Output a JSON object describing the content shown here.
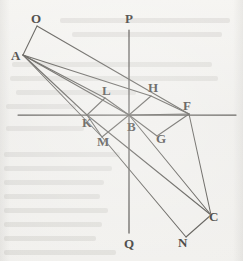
{
  "figure": {
    "background_color": "#f2f1ee",
    "ink_color": "#56544f",
    "label_color": "#3b3936"
  },
  "axes": {
    "vertical": {
      "top_label": "P",
      "bottom_label": "Q",
      "x": 129,
      "y1": 30,
      "y2": 233
    },
    "horizontal": {
      "y": 115,
      "x1": 18,
      "x2": 236
    }
  },
  "points": [
    {
      "id": "O",
      "label": "O",
      "x": 37,
      "y": 26,
      "lx": 31,
      "ly": 12
    },
    {
      "id": "A",
      "label": "A",
      "x": 23,
      "y": 55,
      "lx": 11,
      "ly": 49
    },
    {
      "id": "P",
      "label": "P",
      "x": 129,
      "y": 30,
      "lx": 125,
      "ly": 12
    },
    {
      "id": "L",
      "label": "L",
      "x": 105,
      "y": 98,
      "lx": 102,
      "ly": 84
    },
    {
      "id": "H",
      "label": "H",
      "x": 151,
      "y": 96,
      "lx": 148,
      "ly": 81
    },
    {
      "id": "F",
      "label": "F",
      "x": 189,
      "y": 114,
      "lx": 183,
      "ly": 99
    },
    {
      "id": "K",
      "label": "K",
      "x": 87,
      "y": 115,
      "lx": 82,
      "ly": 116
    },
    {
      "id": "B",
      "label": "B",
      "x": 129,
      "y": 115,
      "lx": 127,
      "ly": 120
    },
    {
      "id": "G",
      "label": "G",
      "x": 157,
      "y": 136,
      "lx": 156,
      "ly": 132
    },
    {
      "id": "M",
      "label": "M",
      "x": 102,
      "y": 137,
      "lx": 97,
      "ly": 135
    },
    {
      "id": "C",
      "label": "C",
      "x": 211,
      "y": 215,
      "lx": 209,
      "ly": 210
    },
    {
      "id": "N",
      "label": "N",
      "x": 186,
      "y": 237,
      "lx": 178,
      "ly": 236
    },
    {
      "id": "Q",
      "label": "Q",
      "x": 129,
      "y": 233,
      "lx": 124,
      "ly": 237
    }
  ],
  "segments": [
    {
      "name": "O-A",
      "from": "O",
      "to": "A"
    },
    {
      "name": "O-F",
      "from": "O",
      "to": "F"
    },
    {
      "name": "A-H",
      "from": "A",
      "to": "H"
    },
    {
      "name": "H-F",
      "from": "H",
      "to": "F"
    },
    {
      "name": "A-B",
      "from": "A",
      "to": "B"
    },
    {
      "name": "B-F",
      "from": "B",
      "to": "F"
    },
    {
      "name": "A-K",
      "from": "A",
      "to": "K"
    },
    {
      "name": "A-M",
      "from": "A",
      "to": "M"
    },
    {
      "name": "A-L",
      "from": "A",
      "to": "L"
    },
    {
      "name": "L-K",
      "from": "L",
      "to": "K"
    },
    {
      "name": "L-B",
      "from": "L",
      "to": "B"
    },
    {
      "name": "H-B",
      "from": "H",
      "to": "B"
    },
    {
      "name": "K-M",
      "from": "K",
      "to": "M"
    },
    {
      "name": "M-B",
      "from": "M",
      "to": "B"
    },
    {
      "name": "K-C",
      "from": "K",
      "to": "C"
    },
    {
      "name": "B-C",
      "from": "B",
      "to": "C"
    },
    {
      "name": "F-C",
      "from": "F",
      "to": "C"
    },
    {
      "name": "B-G",
      "from": "B",
      "to": "G"
    },
    {
      "name": "G-F",
      "from": "G",
      "to": "F"
    },
    {
      "name": "M-N",
      "from": "M",
      "to": "N"
    },
    {
      "name": "N-C",
      "from": "N",
      "to": "C"
    }
  ],
  "bleed_text_lines": [
    {
      "x": 60,
      "y": 18,
      "w": 170
    },
    {
      "x": 72,
      "y": 32,
      "w": 150
    },
    {
      "x": 12,
      "y": 62,
      "w": 200
    },
    {
      "x": 10,
      "y": 76,
      "w": 208
    },
    {
      "x": 16,
      "y": 90,
      "w": 120
    },
    {
      "x": 6,
      "y": 104,
      "w": 70
    },
    {
      "x": 6,
      "y": 126,
      "w": 78
    },
    {
      "x": 4,
      "y": 152,
      "w": 116
    },
    {
      "x": 4,
      "y": 166,
      "w": 108
    },
    {
      "x": 4,
      "y": 180,
      "w": 100
    },
    {
      "x": 4,
      "y": 194,
      "w": 96
    },
    {
      "x": 4,
      "y": 208,
      "w": 104
    },
    {
      "x": 4,
      "y": 222,
      "w": 98
    },
    {
      "x": 4,
      "y": 236,
      "w": 92
    },
    {
      "x": 4,
      "y": 250,
      "w": 112
    }
  ]
}
